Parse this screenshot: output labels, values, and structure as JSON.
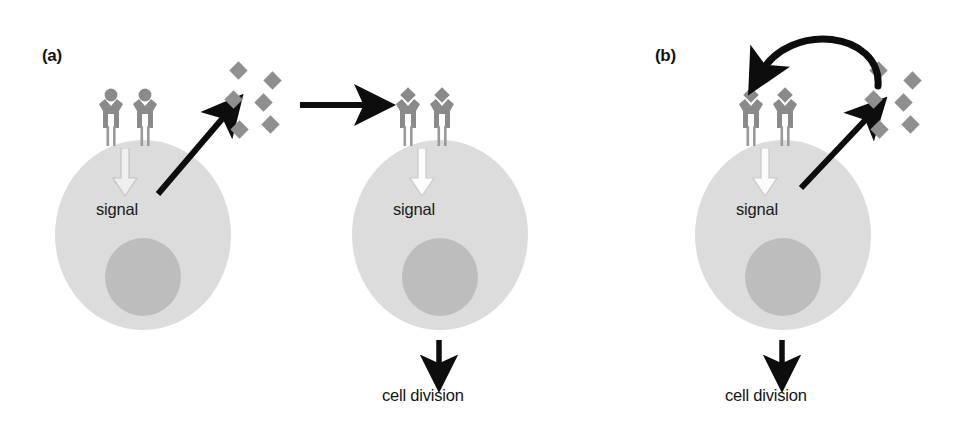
{
  "figure": {
    "width": 965,
    "height": 434,
    "background": "#ffffff",
    "colors": {
      "cell_body": "#dcdcdc",
      "nucleus": "#bdbdbd",
      "receptor": "#8a8a8a",
      "ligand": "#8f8f8f",
      "arrow_black": "#0d0d0d",
      "arrow_white": "#f2f2f2",
      "text": "#141414"
    }
  },
  "panels": [
    {
      "id": "a",
      "label": "(a)",
      "signaling_type": "paracrine",
      "cells": [
        {
          "id": "a-cell-1",
          "role": "signal-secreting-cell",
          "signal_label": "signal",
          "receptor_state": "unbound",
          "receptor_count": 2,
          "nucleus": true
        },
        {
          "id": "a-cell-2",
          "role": "target-cell",
          "signal_label": "signal",
          "receptor_state": "bound",
          "receptor_count": 2,
          "nucleus": true
        }
      ],
      "ligand_cluster": {
        "name": "secreted-ligand-molecules",
        "count": 6
      },
      "arrows": [
        {
          "name": "secretion-arrow",
          "kind": "diagonal-up-right"
        },
        {
          "name": "transfer-arrow",
          "kind": "horizontal-right"
        },
        {
          "name": "cell-division-arrow",
          "kind": "vertical-down"
        }
      ],
      "outcome_label": "cell division"
    },
    {
      "id": "b",
      "label": "(b)",
      "signaling_type": "autocrine",
      "cells": [
        {
          "id": "b-cell-1",
          "role": "self-signaling-cell",
          "signal_label": "signal",
          "receptor_state": "bound",
          "receptor_count": 2,
          "nucleus": true
        }
      ],
      "ligand_cluster": {
        "name": "secreted-ligand-molecules",
        "count": 6
      },
      "arrows": [
        {
          "name": "secretion-arrow",
          "kind": "diagonal-up-right"
        },
        {
          "name": "autocrine-feedback-arrow",
          "kind": "curved-arc-left"
        },
        {
          "name": "cell-division-arrow",
          "kind": "vertical-down"
        }
      ],
      "outcome_label": "cell division"
    }
  ],
  "text": {
    "signal": "signal",
    "cell_division": "cell division",
    "label_a": "(a)",
    "label_b": "(b)"
  }
}
